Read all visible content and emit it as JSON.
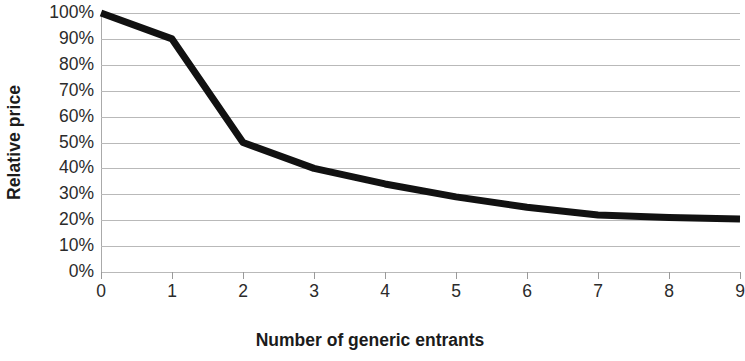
{
  "chart_data": {
    "type": "line",
    "title": "",
    "xlabel": "Number of generic entrants",
    "ylabel": "Relative price",
    "x": [
      0,
      1,
      2,
      3,
      4,
      5,
      6,
      7,
      8,
      9
    ],
    "values": [
      100,
      90,
      50,
      40,
      34,
      29,
      25,
      22,
      21,
      20.5
    ],
    "series": [
      {
        "name": "Relative price",
        "values": [
          100,
          90,
          50,
          40,
          34,
          29,
          25,
          22,
          21,
          20.5
        ]
      }
    ],
    "xlim": [
      0,
      9
    ],
    "ylim": [
      0,
      100
    ],
    "y_tick_labels": [
      "100%",
      "90%",
      "80%",
      "70%",
      "60%",
      "50%",
      "40%",
      "30%",
      "20%",
      "10%",
      "0%"
    ],
    "y_tick_values": [
      100,
      90,
      80,
      70,
      60,
      50,
      40,
      30,
      20,
      10,
      0
    ],
    "x_tick_labels": [
      "0",
      "1",
      "2",
      "3",
      "4",
      "5",
      "6",
      "7",
      "8",
      "9"
    ],
    "x_tick_values": [
      0,
      1,
      2,
      3,
      4,
      5,
      6,
      7,
      8,
      9
    ],
    "grid": "horizontal",
    "legend": "none",
    "line_color": "#111111",
    "grid_color": "#b9b9b9",
    "text_color": "#2b2b2b",
    "axis_title_color": "#1b1b1b",
    "line_width_px": 7
  }
}
